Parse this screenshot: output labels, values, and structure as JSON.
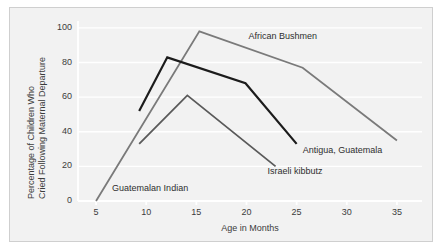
{
  "figure": {
    "background": "#ffffff",
    "panel_background": "#f2f2f2",
    "panel_border": "#cfcfcf",
    "axis_color": "#ffffff",
    "grid_color": "#ffffff"
  },
  "chart_data": {
    "type": "line",
    "title": "",
    "xlabel": "Age in Months",
    "ylabel": "Percentage of Children Who Cried Following Maternal Departure",
    "ylabel_lines": [
      "Percentage of Children Who",
      "Cried Following Maternal Departure"
    ],
    "xlim": [
      3.2,
      37.5
    ],
    "ylim": [
      0,
      104
    ],
    "xticks": [
      5,
      10,
      15,
      20,
      25,
      30,
      35
    ],
    "xtick_labels": [
      "5",
      "10",
      "15",
      "20",
      "25",
      "30",
      "35"
    ],
    "yticks": [
      0,
      20,
      40,
      60,
      80,
      100
    ],
    "ytick_labels": [
      "0",
      "20",
      "40",
      "60",
      "80",
      "100"
    ],
    "grid": "horizontal",
    "legend": "inline-annotations",
    "series": [
      {
        "name": "African Bushmen",
        "color": "#7a7a7a",
        "width": 1.8,
        "label_x": 20.2,
        "label_y": 95,
        "x": [
          5,
          15.3,
          25.6,
          35
        ],
        "y": [
          0,
          98,
          77,
          35
        ]
      },
      {
        "name": "Antigua, Guatemala",
        "color": "#1c1c1c",
        "width": 2.2,
        "label_x": 25.6,
        "label_y": 29,
        "x": [
          9.3,
          12.1,
          19.9,
          25
        ],
        "y": [
          52,
          83,
          68,
          33
        ]
      },
      {
        "name": "Israeli kibbutz",
        "color": "#5a5a5a",
        "width": 1.8,
        "label_x": 22.1,
        "label_y": 17,
        "x": [
          9.3,
          14.1,
          22.9
        ],
        "y": [
          33,
          61,
          20
        ]
      },
      {
        "name": "Guatemalan Indian",
        "color": "#7a7a7a",
        "width": 1.8,
        "label_x": 6.6,
        "label_y": 7,
        "is_label_only": true,
        "x": [],
        "y": []
      }
    ]
  }
}
